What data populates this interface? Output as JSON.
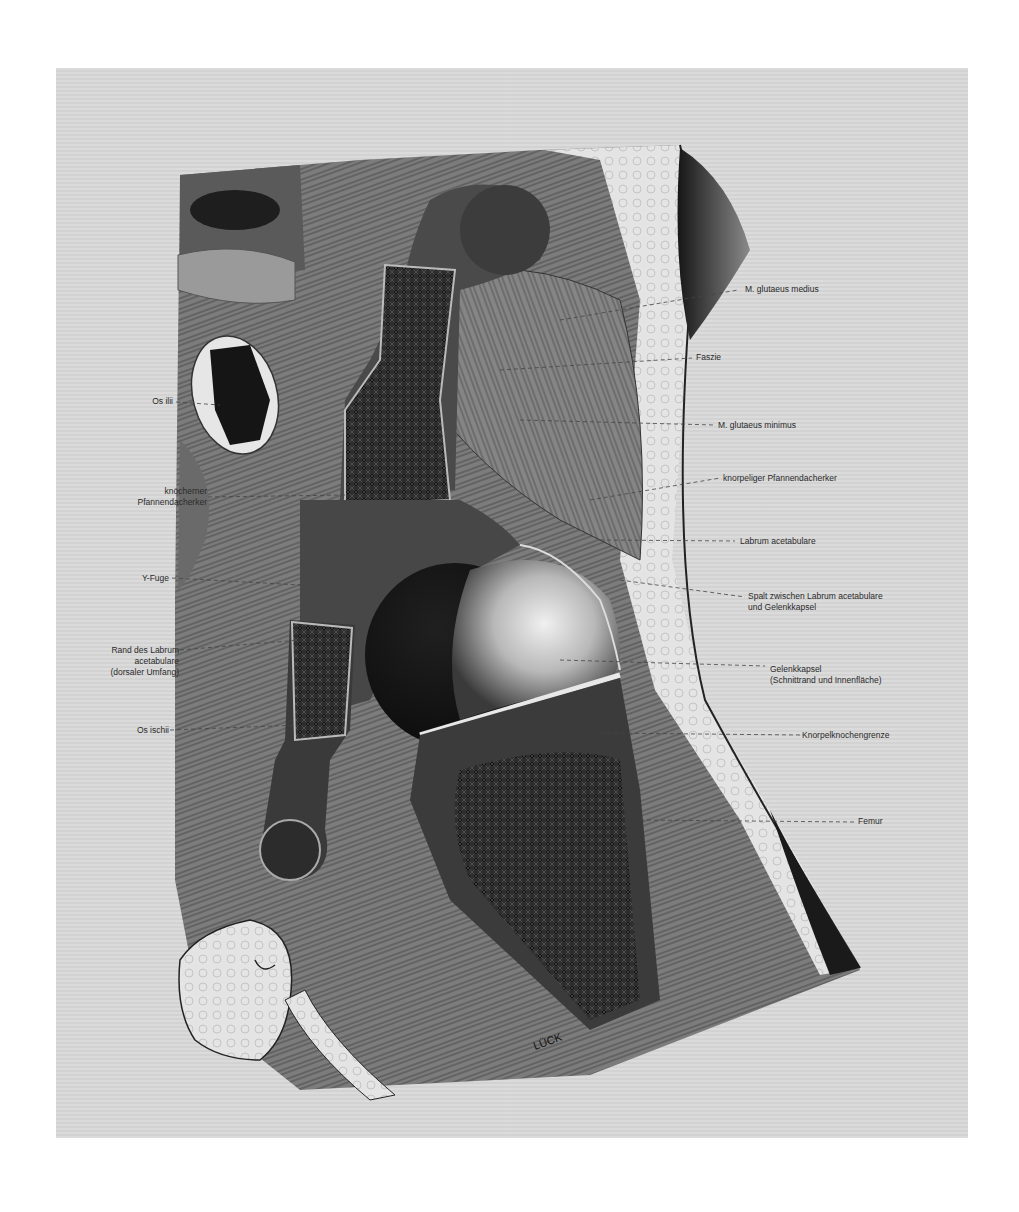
{
  "figure": {
    "signature": "LÜCK",
    "labels_left": [
      {
        "id": "os-ilii",
        "lines": [
          "Os ilii"
        ]
      },
      {
        "id": "knoecherner-pfannendacherker",
        "lines": [
          "knöcherner",
          "Pfannendacherker"
        ]
      },
      {
        "id": "y-fuge",
        "lines": [
          "Y-Fuge"
        ]
      },
      {
        "id": "rand-des-labrum",
        "lines": [
          "Rand des Labrum",
          "acetabulare",
          "(dorsaler Umfang)"
        ]
      },
      {
        "id": "os-ischii",
        "lines": [
          "Os ischii"
        ]
      }
    ],
    "labels_right": [
      {
        "id": "m-glutaeus-medius",
        "lines": [
          "M. glutaeus medius"
        ]
      },
      {
        "id": "faszie",
        "lines": [
          "Faszie"
        ]
      },
      {
        "id": "m-glutaeus-minimus",
        "lines": [
          "M. glutaeus minimus"
        ]
      },
      {
        "id": "knorpeliger-pfannendacherker",
        "lines": [
          "knorpeliger Pfannendacherker"
        ]
      },
      {
        "id": "labrum-acetabulare",
        "lines": [
          "Labrum acetabulare"
        ]
      },
      {
        "id": "spalt",
        "lines": [
          "Spalt zwischen Labrum acetabulare",
          "und Gelenkkapsel"
        ]
      },
      {
        "id": "gelenkkapsel",
        "lines": [
          "Gelenkkapsel",
          "(Schnittrand und Innenfläche)"
        ]
      },
      {
        "id": "knorpelknochengrenze",
        "lines": [
          "Knorpelknochengrenze"
        ]
      },
      {
        "id": "femur",
        "lines": [
          "Femur"
        ]
      }
    ]
  }
}
